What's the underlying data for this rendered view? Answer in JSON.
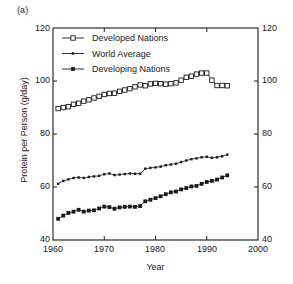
{
  "figure": {
    "panel_label": "(a)",
    "background_color": "#ffffff",
    "axis_color": "#1a1a1a"
  },
  "chart_data": {
    "type": "line",
    "title": "",
    "panel": "(a)",
    "xlabel": "Year",
    "ylabel": "Protein per Person (g/day)",
    "xlim": [
      1960,
      2000
    ],
    "ylim": [
      40,
      120
    ],
    "xticks": [
      1960,
      1970,
      1980,
      1990,
      2000
    ],
    "yticks": [
      40,
      60,
      80,
      100,
      120
    ],
    "xtick_labels": [
      "1960",
      "1970",
      "1980",
      "1990",
      "2000"
    ],
    "ytick_labels": [
      "40",
      "60",
      "80",
      "100",
      "120"
    ],
    "ytick_labels_right": [
      "40",
      "60",
      "80",
      "100",
      "120"
    ],
    "grid": false,
    "legend_position": "top-left",
    "mirrored_y_axis": true,
    "x": [
      1961,
      1962,
      1963,
      1964,
      1965,
      1966,
      1967,
      1968,
      1969,
      1970,
      1971,
      1972,
      1973,
      1974,
      1975,
      1976,
      1977,
      1978,
      1979,
      1980,
      1981,
      1982,
      1983,
      1984,
      1985,
      1986,
      1987,
      1988,
      1989,
      1990,
      1991,
      1992,
      1993,
      1994
    ],
    "series": [
      {
        "name": "Developed Nations",
        "marker": "open-square",
        "color": "#1a1a1a",
        "values": [
          89.6,
          90.0,
          90.3,
          91.2,
          91.6,
          92.4,
          92.9,
          93.6,
          94.2,
          94.9,
          95.3,
          95.4,
          96.1,
          96.6,
          97.1,
          97.8,
          98.5,
          98.2,
          98.9,
          99.1,
          99.0,
          98.8,
          99.0,
          99.3,
          100.3,
          101.4,
          101.8,
          102.6,
          103.0,
          103.0,
          100.3,
          98.3,
          98.3,
          98.2
        ]
      },
      {
        "name": "World Average",
        "marker": "dot-small",
        "color": "#1a1a1a",
        "values": [
          61.2,
          62.3,
          62.9,
          63.4,
          63.6,
          63.4,
          63.8,
          64.0,
          64.2,
          64.8,
          65.1,
          64.5,
          64.7,
          64.9,
          65.1,
          65.0,
          65.0,
          66.9,
          67.2,
          67.4,
          67.7,
          68.2,
          68.5,
          68.8,
          69.4,
          70.0,
          70.5,
          70.8,
          71.2,
          71.4,
          71.0,
          71.2,
          71.6,
          72.2
        ]
      },
      {
        "name": "Developing Nations",
        "marker": "filled-square",
        "color": "#1a1a1a",
        "values": [
          48.0,
          49.2,
          50.2,
          50.7,
          51.4,
          50.7,
          51.1,
          51.2,
          51.9,
          52.6,
          52.4,
          51.8,
          52.3,
          52.5,
          52.6,
          52.5,
          52.8,
          54.6,
          55.2,
          55.8,
          56.5,
          57.3,
          58.0,
          58.3,
          59.1,
          59.6,
          60.2,
          60.4,
          61.2,
          61.9,
          62.3,
          62.8,
          63.6,
          64.4
        ]
      }
    ],
    "legend": [
      {
        "label": "Developed Nations",
        "marker": "open-square"
      },
      {
        "label": "World Average",
        "marker": "dot-small"
      },
      {
        "label": "Developing Nations",
        "marker": "filled-square"
      }
    ]
  }
}
